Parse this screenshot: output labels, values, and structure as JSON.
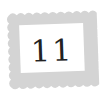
{
  "stamp": {
    "value": "11",
    "icon": "postage-stamp-icon",
    "border_color": "#d4d4d4",
    "text_color": "#222222"
  }
}
